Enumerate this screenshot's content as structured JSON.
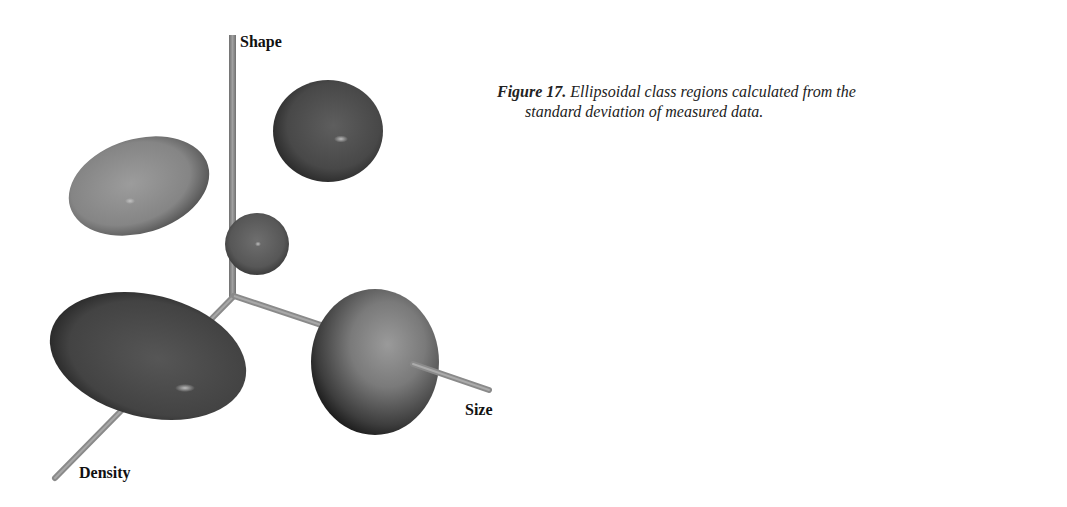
{
  "figure": {
    "number_label": "Figure 17.",
    "caption_line1": "Ellipsoidal class regions calculated from the",
    "caption_line2": "standard deviation of measured data."
  },
  "axes": {
    "shape": "Shape",
    "size": "Size",
    "density": "Density"
  },
  "ellipsoids": [
    {
      "id": "light-gray-upper-left",
      "shade": "#8a8a8a"
    },
    {
      "id": "dark-upper-right",
      "shade": "#4a4a4a"
    },
    {
      "id": "small-sphere-center",
      "shade": "#5a5a5a"
    },
    {
      "id": "large-dark-lower-left",
      "shade": "#454545"
    },
    {
      "id": "sphere-lower-right",
      "shade": "#6a6a6a"
    }
  ],
  "colors": {
    "axis_rod": "#8c8c8c",
    "background": "#ffffff"
  }
}
